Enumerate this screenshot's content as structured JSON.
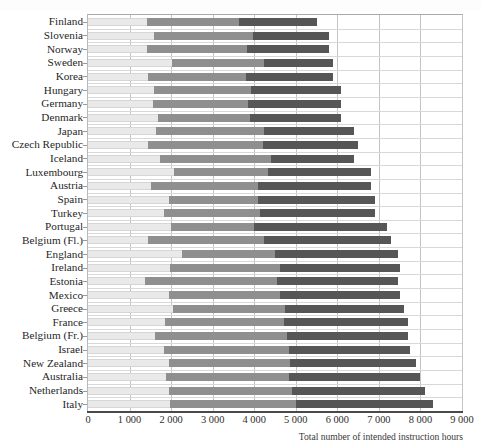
{
  "figure": {
    "clipped_top_caption": "",
    "xlabel": "Total number of intended instruction hours",
    "axis_min": 0,
    "axis_max": 9000,
    "tick_labels": [
      "0",
      "1 000",
      "2 000",
      "3 000",
      "4 000",
      "5 000",
      "6 000",
      "7 000",
      "8 000",
      "9 000"
    ],
    "colors": {
      "primary": "#e9e9e9",
      "lower_secondary": "#8f8f8f",
      "upper_secondary": "#565656",
      "frame": "#b9b9b9",
      "grid": "#cfcfcf",
      "axis": "#4a4a4a"
    }
  },
  "chart_data": {
    "type": "bar",
    "orientation": "horizontal",
    "stacked": true,
    "title": "",
    "xlabel": "Total number of intended instruction hours",
    "ylabel": "",
    "xlim": [
      0,
      9000
    ],
    "xticks": [
      0,
      1000,
      2000,
      3000,
      4000,
      5000,
      6000,
      7000,
      8000,
      9000
    ],
    "xtick_labels": [
      "0",
      "1 000",
      "2 000",
      "3 000",
      "4 000",
      "5 000",
      "6 000",
      "7 000",
      "8 000",
      "9 000"
    ],
    "grid": true,
    "legend": null,
    "legend_position": "none",
    "categories": [
      "Finland",
      "Slovenia",
      "Norway",
      "Sweden",
      "Korea",
      "Hungary",
      "Germany",
      "Denmark",
      "Japan",
      "Czech Republic",
      "Iceland",
      "Luxembourg",
      "Austria",
      "Spain",
      "Turkey",
      "Portugal",
      "Belgium (Fl.)",
      "England",
      "Ireland",
      "Estonia",
      "Mexico",
      "Greece",
      "France",
      "Belgium (Fr.)",
      "Israel",
      "New Zealand",
      "Australia",
      "Netherlands",
      "Italy"
    ],
    "series": [
      {
        "name": "Primary",
        "color": "#e9e9e9",
        "values": [
          1430,
          1580,
          1420,
          2030,
          1450,
          1600,
          1560,
          1690,
          1630,
          1450,
          1730,
          2080,
          1510,
          1950,
          1830,
          2000,
          1450,
          2250,
          1970,
          1370,
          1960,
          2050,
          1850,
          1620,
          1830,
          1960,
          1880,
          1960,
          1970
        ]
      },
      {
        "name": "Lower secondary",
        "color": "#8f8f8f",
        "values": [
          2200,
          2400,
          2400,
          2200,
          2350,
          2330,
          2300,
          2200,
          2600,
          2750,
          2670,
          2250,
          2590,
          2150,
          2320,
          2000,
          2780,
          2260,
          2660,
          3180,
          2650,
          2700,
          2870,
          3180,
          3000,
          2890,
          2960,
          2960,
          3030
        ]
      },
      {
        "name": "Upper secondary",
        "color": "#565656",
        "values": [
          1870,
          1820,
          1980,
          1670,
          2100,
          2170,
          2240,
          2210,
          2170,
          2300,
          2000,
          2470,
          2700,
          2800,
          2750,
          3200,
          3070,
          2940,
          2870,
          2900,
          2890,
          2850,
          2980,
          2900,
          2920,
          3050,
          3160,
          3180,
          3300
        ]
      }
    ],
    "totals": [
      5500,
      5800,
      5800,
      5900,
      5900,
      6100,
      6100,
      6100,
      6400,
      6500,
      6400,
      6800,
      6800,
      6900,
      6900,
      7200,
      7300,
      7450,
      7500,
      7450,
      7500,
      7600,
      7700,
      7700,
      7750,
      7900,
      8000,
      8100,
      8300
    ]
  }
}
